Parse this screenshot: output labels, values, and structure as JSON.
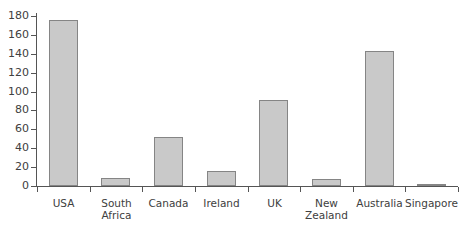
{
  "chart_data": {
    "type": "bar",
    "title": "",
    "subtitle": "",
    "xlabel": "",
    "ylabel": "",
    "categories": [
      "USA",
      "South\nAfrica",
      "Canada",
      "Ireland",
      "UK",
      "New\nZealand",
      "Australia",
      "Singapore"
    ],
    "values": [
      176,
      8,
      52,
      16,
      91,
      7,
      143,
      2
    ],
    "ylim": [
      0,
      180
    ],
    "yticks": [
      0,
      20,
      40,
      60,
      80,
      100,
      120,
      140,
      160,
      180
    ],
    "ytick_labels": [
      "0",
      "20",
      "40",
      "60",
      "80",
      "100",
      "120",
      "140",
      "160",
      "180"
    ],
    "grid": false,
    "legend": null,
    "legend_position": "none",
    "bar_fill_color": "#c9c9c9",
    "bar_edge_color": "#858585",
    "axis_color": "#555555",
    "text_color": "#404040",
    "background_color": "#ffffff"
  }
}
